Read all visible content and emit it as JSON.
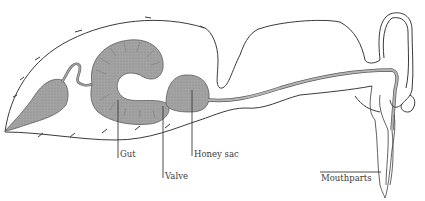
{
  "diagram": {
    "colors": {
      "outline": "#3a3a3a",
      "organ_fill": "#9e9e9e",
      "organ_stroke": "#5a5a5a",
      "tube_fill": "#b5b5b5",
      "background": "#ffffff"
    },
    "labels": {
      "gut": "Gut",
      "valve": "Valve",
      "honey_sac": "Honey sac",
      "mouthparts": "Mouthparts"
    }
  }
}
